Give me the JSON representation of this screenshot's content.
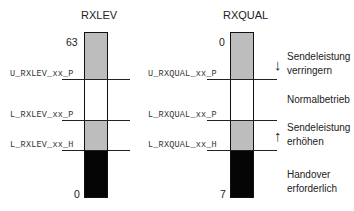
{
  "diagram": {
    "columns": [
      {
        "title": "RXLEV",
        "top_value": "63",
        "bottom_value": "0",
        "thresholds": [
          "U_RXLEV_xx_P",
          "L_RXLEV_xx_P",
          "L_RXLEV_xx_H"
        ]
      },
      {
        "title": "RXQUAL",
        "top_value": "0",
        "bottom_value": "7",
        "thresholds": [
          "U_RXQUAL_xx_P",
          "L_RXQUAL_xx_P",
          "L_RXQUAL_xx_H"
        ]
      }
    ],
    "zones": [
      {
        "name": "reduce-power",
        "color": "#bdbdbd",
        "label_line1": "Sendeleistung",
        "label_line2": "verringern",
        "arrow": "down"
      },
      {
        "name": "normal",
        "color": "#ffffff",
        "label_line1": "Normalbetrieb",
        "label_line2": ""
      },
      {
        "name": "increase-power",
        "color": "#bdbdbd",
        "label_line1": "Sendeleistung",
        "label_line2": "erhöhen",
        "arrow": "up"
      },
      {
        "name": "handover",
        "color": "#050505",
        "label_line1": "Handover",
        "label_line2": "erforderlich"
      }
    ],
    "arrows": {
      "down": "↓",
      "up": "↑"
    }
  }
}
